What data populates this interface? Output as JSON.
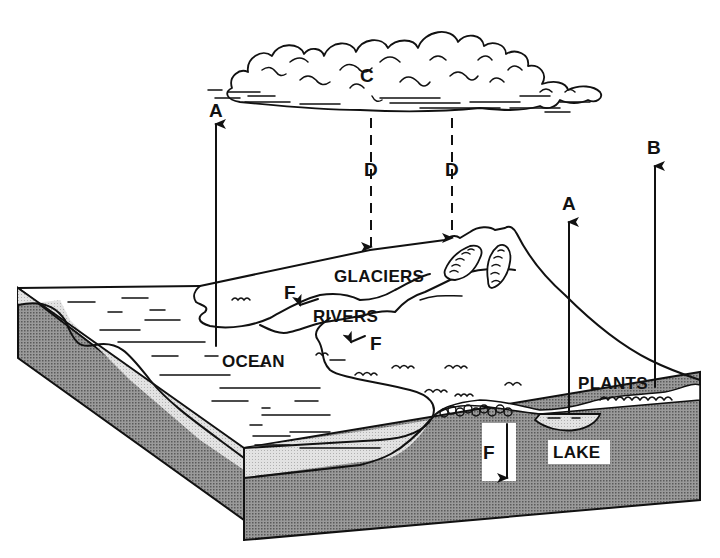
{
  "diagram": {
    "type": "water-cycle",
    "cloud_label": "C",
    "labels": {
      "evaporation_ocean": "A",
      "evaporation_lake": "A",
      "transpiration": "B",
      "cloud": "C",
      "precipitation_1": "D",
      "precipitation_2": "D",
      "runoff_1": "F",
      "runoff_2": "F",
      "infiltration": "F"
    },
    "places": {
      "glaciers": "GLACIERS",
      "rivers": "RIVERS",
      "ocean": "OCEAN",
      "plants": "PLANTS",
      "lake": "LAKE"
    },
    "colors": {
      "ink": "#111111",
      "surface_shade": "#d8d8d8",
      "ground_shade": "#8a8a8a",
      "background": "#ffffff"
    }
  }
}
